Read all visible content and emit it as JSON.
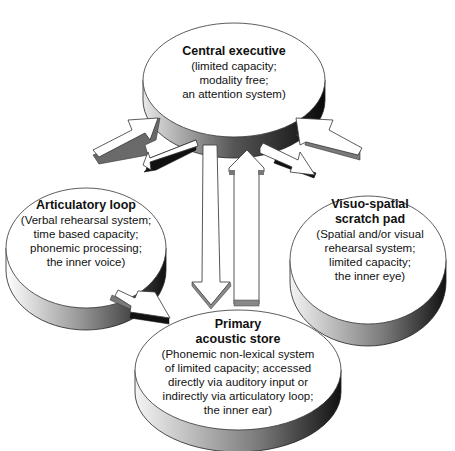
{
  "diagram": {
    "type": "working-memory-model",
    "nodes": {
      "central_executive": {
        "title": "Central executive",
        "desc": [
          "(limited capacity;",
          "modality free;",
          "an attention system)"
        ]
      },
      "articulatory_loop": {
        "title": "Articulatory loop",
        "desc": [
          "(Verbal rehearsal system;",
          "time based capacity;",
          "phonemic processing;",
          "the inner voice)"
        ]
      },
      "visuo_spatial": {
        "title": [
          "Visuo-spatial",
          "scratch pad"
        ],
        "desc": [
          "(Spatial and/or visual",
          "rehearsal system;",
          "limited capacity;",
          "the inner eye)"
        ]
      },
      "primary_acoustic_store": {
        "title": [
          "Primary",
          "acoustic store"
        ],
        "desc": [
          "(Phonemic non-lexical system",
          "of limited capacity; accessed",
          "directly via auditory input or",
          "indirectly via articulatory loop;",
          "the inner ear)"
        ]
      }
    },
    "edges": [
      {
        "from": "articulatory_loop",
        "to": "central_executive"
      },
      {
        "from": "central_executive",
        "to": "articulatory_loop"
      },
      {
        "from": "visuo_spatial",
        "to": "central_executive"
      },
      {
        "from": "central_executive",
        "to": "visuo_spatial"
      },
      {
        "from": "central_executive",
        "to": "primary_acoustic_store"
      },
      {
        "from": "primary_acoustic_store",
        "to": "central_executive"
      },
      {
        "from": "articulatory_loop",
        "to": "primary_acoustic_store"
      }
    ]
  }
}
